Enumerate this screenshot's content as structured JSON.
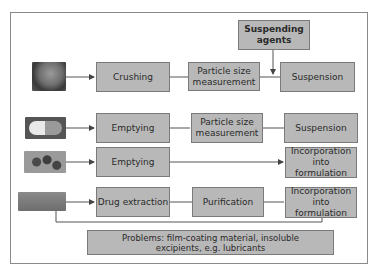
{
  "diagram": {
    "rows": [
      {
        "image": "tablet-image",
        "steps": [
          "Crushing",
          "Particle size measurement",
          "Suspension"
        ]
      },
      {
        "image": "capsule-image",
        "steps": [
          "Emptying",
          "Particle size measurement",
          "Suspension"
        ]
      },
      {
        "image": "soft-capsules-image",
        "steps": [
          "Emptying",
          "Incorporation into formulation"
        ]
      },
      {
        "image": "tablet-strip-image",
        "steps": [
          "Drug extraction",
          "Purification",
          "Incorporation into formulation"
        ]
      }
    ],
    "suspending_agents": "Suspending agents",
    "problems": "Problems: film-coating material, insoluble excipients, e.g. lubricants",
    "colors": {
      "box_fill": "#b8b8b8",
      "box_border": "#7a7a7a",
      "line": "#555555"
    }
  }
}
